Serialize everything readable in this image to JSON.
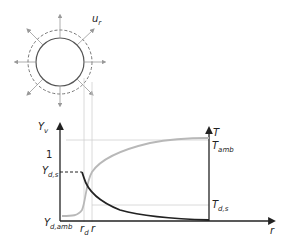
{
  "diagram": {
    "droplet": {
      "velocity_label": "u",
      "velocity_sub": "r",
      "radial_arrows": 8
    },
    "axes": {
      "left_axis_label": "Y",
      "left_axis_sub": "v",
      "right_axis_label": "T",
      "x_axis_label": "r"
    },
    "ticks": {
      "one": "1",
      "yds": "Y",
      "yds_sub": "d,s",
      "ydamb": "Y",
      "ydamb_sub": "d,amb",
      "rd": "r",
      "rd_sub": "d",
      "r": "r",
      "tamb": "T",
      "tamb_sub": "amb",
      "tds": "T",
      "tds_sub": "d,s"
    },
    "colors": {
      "axis": "#222222",
      "vapor_curve": "#222222",
      "temperature_curve": "#b8b8b8",
      "guide_lines": "#d0d0d0",
      "droplet_outline": "#555555"
    },
    "curves": [
      {
        "name": "vapor mass fraction Y_v",
        "shape": "constant Y_d,s up to r_d, then decays to Y_d,amb"
      },
      {
        "name": "temperature T",
        "shape": "near T_d,s inside droplet, rises steeply at r_d and saturates to T_amb"
      }
    ]
  }
}
